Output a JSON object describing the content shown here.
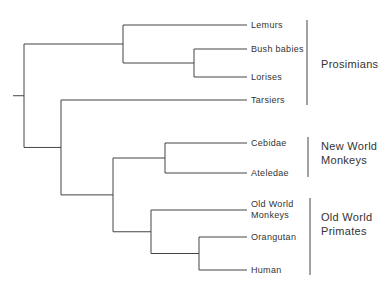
{
  "diagram": {
    "type": "phylogenetic-tree",
    "taxa": [
      {
        "id": "lemurs",
        "label": "Lemurs"
      },
      {
        "id": "bush_babies",
        "label": "Bush babies"
      },
      {
        "id": "lorises",
        "label": "Lorises"
      },
      {
        "id": "tarsiers",
        "label": "Tarsiers"
      },
      {
        "id": "cebidae",
        "label": "Cebidae"
      },
      {
        "id": "ateledae",
        "label": "Ateledae"
      },
      {
        "id": "old_world_monkeys",
        "label": [
          "Old World",
          "Monkeys"
        ]
      },
      {
        "id": "orangutan",
        "label": "Orangutan"
      },
      {
        "id": "human",
        "label": "Human"
      }
    ],
    "tree": "(((Lemurs,(Bush babies,Lorises)),(Tarsiers,((Cebidae,Ateledae),(Old World Monkeys,(Orangutan,Human))))))",
    "groups": [
      {
        "id": "prosimians",
        "label": [
          "Prosimians"
        ],
        "members": [
          "lemurs",
          "bush_babies",
          "lorises",
          "tarsiers"
        ]
      },
      {
        "id": "new_world_monkeys",
        "label": [
          "New World",
          "Monkeys"
        ],
        "members": [
          "cebidae",
          "ateledae"
        ]
      },
      {
        "id": "old_world_primates",
        "label": [
          "Old World",
          "Primates"
        ],
        "members": [
          "old_world_monkeys",
          "orangutan",
          "human"
        ]
      }
    ]
  }
}
